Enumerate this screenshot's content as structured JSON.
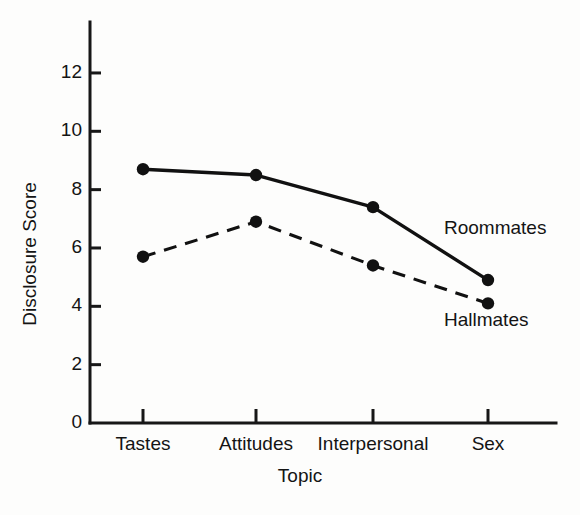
{
  "chart_data": {
    "type": "line",
    "title": "",
    "xlabel": "Topic",
    "ylabel": "Disclosure Score",
    "categories": [
      "Tastes",
      "Attitudes",
      "Interpersonal",
      "Sex"
    ],
    "yticks": [
      0,
      2,
      4,
      6,
      8,
      10,
      12
    ],
    "ytick_labels": [
      "0",
      "2",
      "4",
      "6",
      "8",
      "10",
      "12"
    ],
    "ylim": [
      0,
      13.7
    ],
    "grid": false,
    "legend_position": "inline-right",
    "series": [
      {
        "name": "Roommates",
        "style": "solid",
        "marker": "filled-circle",
        "color": "#111111",
        "values": [
          8.7,
          8.5,
          7.4,
          4.9
        ]
      },
      {
        "name": "Hallmates",
        "style": "dashed",
        "marker": "filled-circle",
        "color": "#111111",
        "values": [
          5.7,
          6.9,
          5.4,
          4.1
        ]
      }
    ],
    "annotations": [
      {
        "text": "Roommates",
        "series": "Roommates"
      },
      {
        "text": "Hallmates",
        "series": "Hallmates"
      }
    ]
  }
}
